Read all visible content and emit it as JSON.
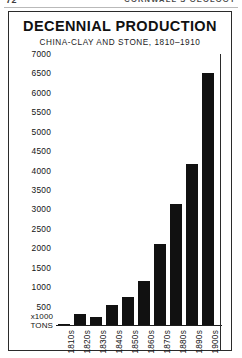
{
  "page": {
    "folio": "72",
    "running_head": "CORNWALL'S GEOLOGY"
  },
  "figure": {
    "title": "DECENNIAL PRODUCTION",
    "subtitle": "CHINA-CLAY AND STONE, 1810–1910",
    "unit_label_line1": "x1000",
    "unit_label_line2": "TONS"
  },
  "chart_data": {
    "type": "bar",
    "title": "DECENNIAL PRODUCTION",
    "subtitle": "CHINA-CLAY AND STONE, 1810–1910",
    "xlabel": "",
    "ylabel": "x1000 TONS",
    "categories": [
      "1810s",
      "1820s",
      "1830s",
      "1840s",
      "1850s",
      "1860s",
      "1870s",
      "1880s",
      "1890s",
      "1900s"
    ],
    "values": [
      60,
      320,
      240,
      530,
      750,
      1150,
      2100,
      3150,
      4180,
      6500
    ],
    "ylim": [
      0,
      7000
    ],
    "yticks": [
      500,
      1000,
      1500,
      2000,
      2500,
      3000,
      3500,
      4000,
      4500,
      5000,
      5500,
      6000,
      6500,
      7000
    ],
    "ytick_labels": [
      "500",
      "1000",
      "1500",
      "2000",
      "2500",
      "3000",
      "3500",
      "4000",
      "4500",
      "5000",
      "5500",
      "6000",
      "6500",
      "7000"
    ],
    "grid": false,
    "legend": null,
    "bar_color": "#111111",
    "background_color": "#ffffff"
  }
}
